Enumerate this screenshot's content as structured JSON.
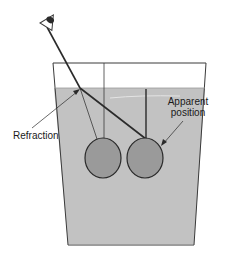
{
  "diagram": {
    "labels": {
      "refraction": "Refraction",
      "apparent_line1": "Apparent",
      "apparent_line2": "position"
    },
    "colors": {
      "background": "#ffffff",
      "glass_outline": "#3a3a3a",
      "water": "#c2c2c2",
      "ball_fill": "#9a9a9a",
      "ball_stroke": "#2a2a2a",
      "ray": "#2a2a2a"
    },
    "elements": {
      "eye": "eye-icon",
      "glass": "beaker-glass",
      "water": "water-fill",
      "real_object": "real-ball",
      "apparent_object": "apparent-ball"
    }
  }
}
